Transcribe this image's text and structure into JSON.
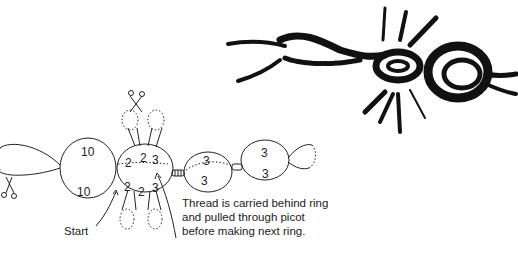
{
  "diagram": {
    "type": "tatting-pattern",
    "illustration": "photo-sketch of finished tatted motif (chains, center ring with picots, right ring)",
    "rings": [
      {
        "id": "ring-1",
        "counts": [
          "10",
          "10"
        ]
      },
      {
        "id": "ring-center",
        "counts": [
          "2",
          "2",
          "3",
          "2",
          "2",
          "3"
        ]
      },
      {
        "id": "ring-3",
        "counts": [
          "3",
          "3"
        ]
      },
      {
        "id": "ring-4",
        "counts": [
          "3",
          "3"
        ]
      }
    ],
    "labels": {
      "start": "Start",
      "caption_lines": [
        "Thread is carried behind ring",
        "and pulled through picot",
        "before making next ring."
      ]
    },
    "icons": [
      "scissors-icon-top",
      "scissors-icon-left"
    ],
    "colors": {
      "ink": "#1a1a1a",
      "background": "#ffffff"
    }
  }
}
